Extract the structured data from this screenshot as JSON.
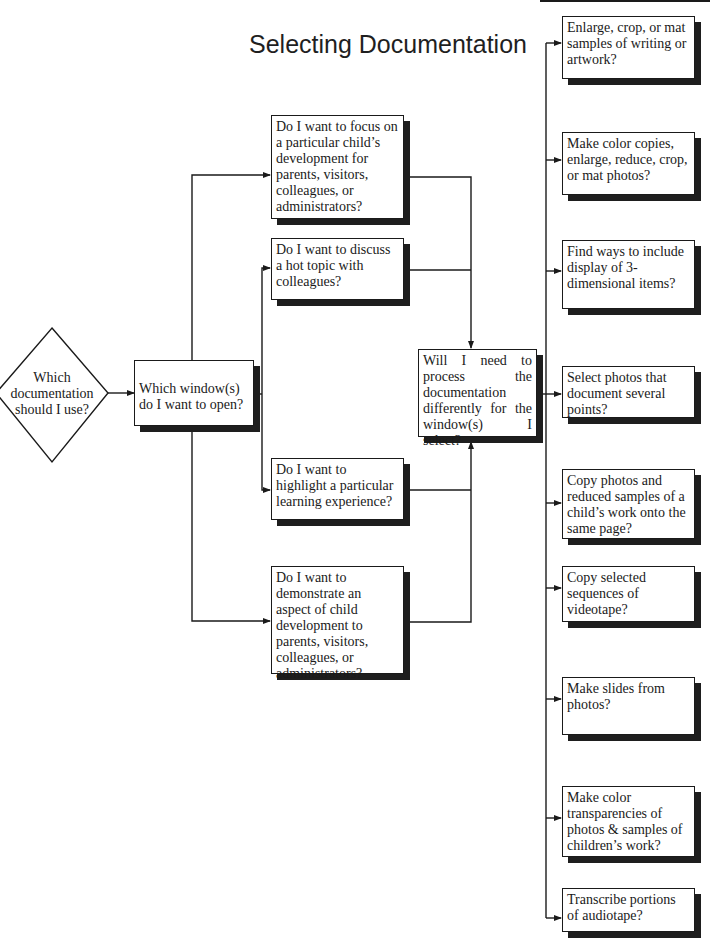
{
  "title": "Selecting Documentation",
  "start": {
    "shape": "diamond",
    "text": "Which documentation should I use?"
  },
  "step1": {
    "text": "Which window(s) do I want to open?"
  },
  "windows": [
    {
      "text": "Do I want to focus on a particular child’s development for parents, visitors, colleagues, or administrators?"
    },
    {
      "text": "Do I want to discuss a hot topic with colleagues?"
    },
    {
      "text": "Do I want to highlight a particular learning experience?"
    },
    {
      "text": "Do I want to demonstrate an aspect of child development to parents, visitors, colleagues, or administrators?"
    }
  ],
  "process": {
    "text": "Will I need to process the documentation differently for the window(s) I select?"
  },
  "options": [
    {
      "text": "Enlarge, crop, or mat samples of writing or artwork?"
    },
    {
      "text": "Make color copies, enlarge, reduce, crop, or mat photos?"
    },
    {
      "text": "Find ways to include display of 3-dimensional items?"
    },
    {
      "text": "Select photos that document several points?"
    },
    {
      "text": "Copy photos and reduced samples of a child’s work onto the same page?"
    },
    {
      "text": "Copy selected sequences of videotape?"
    },
    {
      "text": "Make slides from photos?"
    },
    {
      "text": "Make color transparencies of photos & samples of children’s work?"
    },
    {
      "text": "Transcribe portions of audiotape?"
    }
  ],
  "colors": {
    "line": "#1a1a1a",
    "shadow": "#1e1e1e",
    "background": "#ffffff"
  }
}
